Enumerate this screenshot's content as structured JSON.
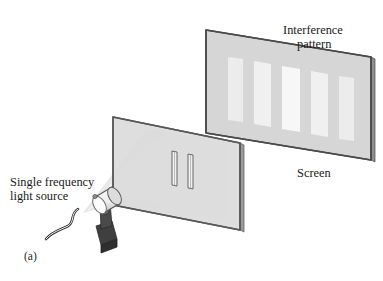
{
  "figure": {
    "caption": "(a)",
    "title_implied": "Double-slit interference experiment",
    "background_color": "#ffffff"
  },
  "labels": {
    "source_line1": "Single frequency",
    "source_line2": "light source",
    "pattern_line1": "Interference",
    "pattern_line2": "pattern",
    "screen": "Screen"
  },
  "colors": {
    "screen_face": "#d6d6d6",
    "screen_edge": "#4a4a4a",
    "screen_side": "#8f8f8f",
    "barrier_face": "#d9d9d9",
    "barrier_edge": "#585858",
    "fringe_bright": "#f2f2f2",
    "fringe_mid": "#e8e8e8",
    "beam": "#ededed",
    "lamp_body": "#e8e8e8",
    "lamp_shade": "#b8b8b8",
    "mount_dark": "#4d4d4d",
    "cord": "#3a3a3a",
    "text": "#1a1a1a"
  },
  "components": {
    "light_source": {
      "name": "Single frequency light source",
      "shape": "cylindrical lamp on dark bracket mount",
      "has_power_cord": true
    },
    "barrier": {
      "name": "Double-slit barrier",
      "slit_count": 2,
      "slit_orientation": "vertical"
    },
    "screen": {
      "name": "Screen",
      "fringe_count": 5,
      "fringe_relative_brightness": [
        0.72,
        0.88,
        1.0,
        0.88,
        0.72
      ]
    },
    "beam": {
      "name": "Light beam cone",
      "spreads_from": "light source",
      "spreads_to": "barrier"
    }
  }
}
